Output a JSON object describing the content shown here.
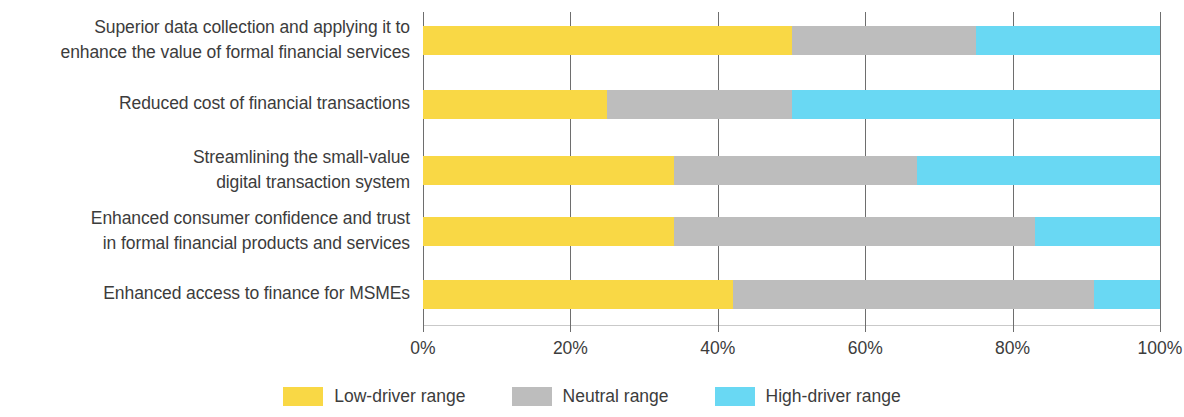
{
  "chart_data": {
    "type": "bar",
    "orientation": "horizontal",
    "stacked": true,
    "stack_total": 100,
    "title": "",
    "subtitle": "",
    "xlabel": "",
    "ylabel": "",
    "xlim": [
      0,
      100
    ],
    "grid": true,
    "legend_position": "bottom",
    "xticks": [
      0,
      20,
      40,
      60,
      80,
      100
    ],
    "xtick_labels": [
      "0%",
      "20%",
      "40%",
      "60%",
      "80%",
      "100%"
    ],
    "categories": [
      "Superior data collection and applying it to enhance the value of formal financial services",
      "Reduced cost of financial transactions",
      "Streamlining the small-value digital transaction system",
      "Enhanced consumer confidence and trust in formal financial products and services",
      "Enhanced access to finance for MSMEs"
    ],
    "category_lines": [
      [
        "Superior data collection and applying it to",
        "enhance the value of formal financial services"
      ],
      [
        "Reduced cost of financial transactions"
      ],
      [
        "Streamlining the small-value",
        "digital transaction system"
      ],
      [
        "Enhanced consumer confidence and trust",
        "in formal financial products and services"
      ],
      [
        "Enhanced access to finance for MSMEs"
      ]
    ],
    "series": [
      {
        "name": "Low-driver range",
        "color": "#f9d845",
        "values": [
          50,
          25,
          34,
          34,
          42
        ]
      },
      {
        "name": "Neutral range",
        "color": "#bdbdbd",
        "values": [
          25,
          25,
          33,
          49,
          49
        ]
      },
      {
        "name": "High-driver range",
        "color": "#69d8f3",
        "values": [
          25,
          50,
          33,
          17,
          9
        ]
      }
    ]
  },
  "legend": {
    "items": [
      {
        "label": "Low-driver range",
        "color": "#f9d845"
      },
      {
        "label": "Neutral range",
        "color": "#bdbdbd"
      },
      {
        "label": "High-driver range",
        "color": "#69d8f3"
      }
    ]
  },
  "colors": {
    "low_driver": "#f9d845",
    "neutral": "#bdbdbd",
    "high_driver": "#69d8f3",
    "gridline": "#6e6e6e",
    "text": "#3c3c3c"
  }
}
